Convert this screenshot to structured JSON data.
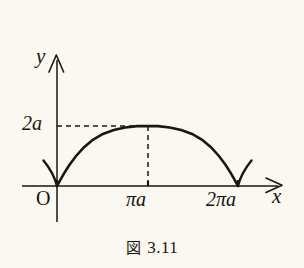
{
  "figure": {
    "caption_symbol": "図",
    "caption_number": "3.11",
    "background_color": "#faf8f1",
    "ink_color": "#1a1713"
  },
  "axes": {
    "y_label": "y",
    "x_label": "x",
    "origin_label": "O",
    "y_tick_labels": [
      "2a"
    ],
    "x_tick_labels": [
      "πa",
      "2πa"
    ]
  },
  "chart_data": {
    "type": "line",
    "xlabel": "x",
    "ylabel": "y",
    "curve_name": "cycloid-arch",
    "xlim": [
      0,
      6.283185
    ],
    "ylim": [
      0,
      2
    ],
    "x_ticks": [
      0,
      3.141593,
      6.283185
    ],
    "x_tick_labels": [
      "O",
      "πa",
      "2πa"
    ],
    "y_ticks": [
      2
    ],
    "y_tick_labels": [
      "2a"
    ],
    "grid": false,
    "legend": "none",
    "annotations": [
      {
        "text": "2a",
        "type": "dashed-guide-horizontal",
        "y": 2,
        "from_x": 0,
        "to_x": 3.141593
      },
      {
        "text": "πa",
        "type": "dashed-guide-vertical",
        "x": 3.141593,
        "from_y": 0,
        "to_y": 2
      }
    ],
    "x": [
      0.0,
      0.0267,
      0.1069,
      0.2397,
      0.4232,
      0.6547,
      0.9303,
      1.2454,
      1.5944,
      1.9712,
      2.369,
      2.7809,
      3.1416,
      3.5023,
      3.9142,
      4.312,
      4.6888,
      5.0378,
      5.3529,
      5.6285,
      5.86,
      6.0435,
      6.1763,
      6.2565,
      6.2832
    ],
    "y": [
      0.0,
      0.0489,
      0.191,
      0.4122,
      0.6903,
      0.9923,
      1.2856,
      1.5406,
      1.7361,
      1.866,
      1.9511,
      1.9945,
      2.0,
      1.9945,
      1.9511,
      1.866,
      1.7361,
      1.5406,
      1.2856,
      0.9923,
      0.6903,
      0.4122,
      0.191,
      0.0489,
      0.0
    ]
  }
}
